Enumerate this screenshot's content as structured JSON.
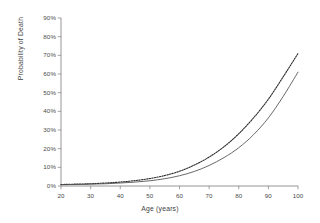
{
  "chart_data": {
    "type": "line",
    "title": "",
    "xlabel": "Age (years)",
    "ylabel": "Probability of Death",
    "xlim": [
      20,
      100
    ],
    "ylim": [
      0,
      90
    ],
    "grid": false,
    "legend": "none",
    "x_tick_labels": [
      "20",
      "30",
      "40",
      "50",
      "60",
      "70",
      "80",
      "90",
      "100"
    ],
    "x_ticks": [
      20,
      30,
      40,
      50,
      60,
      70,
      80,
      90,
      100
    ],
    "y_tick_labels": [
      "0%",
      "10%",
      "20%",
      "30%",
      "40%",
      "50%",
      "60%",
      "70%",
      "80%",
      "90%"
    ],
    "y_ticks": [
      0,
      10,
      20,
      30,
      40,
      50,
      60,
      70,
      80,
      90
    ],
    "x": [
      20,
      25,
      30,
      35,
      40,
      45,
      50,
      55,
      60,
      65,
      70,
      75,
      80,
      85,
      90,
      95,
      100
    ],
    "series": [
      {
        "name": "dotted-curve",
        "style": "dotted",
        "color": "#2b2b2b",
        "values": [
          0.8,
          1.0,
          1.2,
          1.6,
          2.1,
          2.9,
          4.0,
          5.6,
          7.9,
          11.2,
          15.5,
          21.0,
          28.0,
          36.5,
          46.5,
          58.5,
          71.0
        ]
      },
      {
        "name": "solid-curve",
        "style": "solid",
        "color": "#4d4d4d",
        "values": [
          0.7,
          0.8,
          1.0,
          1.2,
          1.6,
          2.1,
          2.8,
          3.9,
          5.5,
          7.8,
          11.0,
          15.2,
          20.5,
          27.5,
          36.5,
          48.0,
          61.0
        ]
      }
    ]
  },
  "axis_style": {
    "axis_color": "#8a8a8a",
    "tick_color": "#8a8a8a"
  }
}
